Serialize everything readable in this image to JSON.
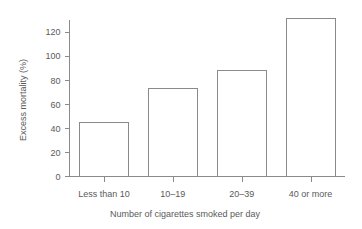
{
  "chart_data": {
    "type": "bar",
    "title": "",
    "subtitle": "",
    "xlabel": "Number of cigarettes smoked per day",
    "ylabel": "Excess mortality (%)",
    "categories": [
      "Less than 10",
      "10–19",
      "20–39",
      "40 or more"
    ],
    "values": [
      45,
      73,
      88,
      131
    ],
    "ylim": [
      0,
      135
    ],
    "yticks": [
      0,
      20,
      40,
      60,
      80,
      100,
      120
    ],
    "ytick_labels": [
      "0",
      "20",
      "40",
      "60",
      "80",
      "100",
      "120"
    ],
    "grid": false,
    "legend": false,
    "legend_position": "none",
    "bar_fill": "#ffffff",
    "bar_stroke": "#8a8a8a",
    "axis_color": "#8a8a8a",
    "text_color": "#5a5a5a",
    "background": "#ffffff"
  }
}
